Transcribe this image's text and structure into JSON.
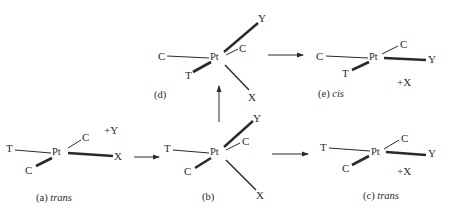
{
  "diagram": {
    "colors": {
      "ink": "#2a2a2a",
      "background": "#ffffff"
    },
    "structures": {
      "a": {
        "caption_prefix": "(a)",
        "caption_italic": "trans",
        "center": "Pt",
        "ligands": {
          "left": "T",
          "upper_right": "C",
          "lower_left": "C",
          "right": "X"
        },
        "incoming": "+Y"
      },
      "b": {
        "caption_prefix": "(b)",
        "caption_italic": "",
        "center": "Pt",
        "ligands": {
          "left": "T",
          "upper_right_small": "C",
          "lower_left": "C",
          "top_right": "Y",
          "bottom_right": "X"
        }
      },
      "d": {
        "caption_prefix": "(d)",
        "caption_italic": "",
        "center": "Pt",
        "ligands": {
          "left": "C",
          "upper_right_small": "C",
          "lower_left": "T",
          "top_right": "Y",
          "bottom_right": "X"
        }
      },
      "e": {
        "caption_prefix": "(e)",
        "caption_italic": "cis",
        "center": "Pt",
        "ligands": {
          "left": "C",
          "upper_right": "C",
          "lower_left": "T",
          "right": "Y"
        },
        "leaving": "+X"
      },
      "c": {
        "caption_prefix": "(c)",
        "caption_italic": "trans",
        "center": "Pt",
        "ligands": {
          "left": "T",
          "upper_right": "C",
          "lower_left": "C",
          "right": "Y"
        },
        "leaving": "+X"
      }
    },
    "arrows": [
      {
        "from": "a",
        "to": "b",
        "direction": "right"
      },
      {
        "from": "b",
        "to": "d",
        "direction": "up"
      },
      {
        "from": "d",
        "to": "e",
        "direction": "right"
      },
      {
        "from": "b",
        "to": "c",
        "direction": "right"
      }
    ]
  }
}
